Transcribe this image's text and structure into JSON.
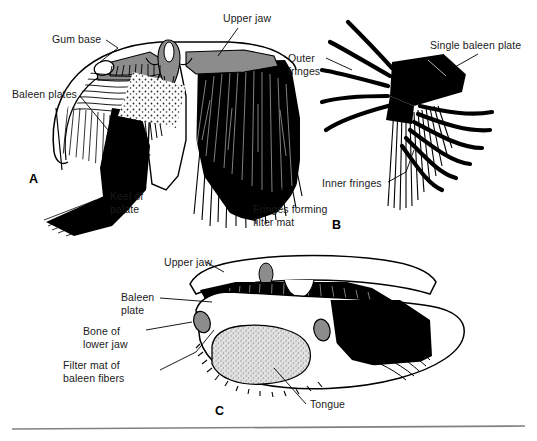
{
  "figure": {
    "background_color": "#ffffff",
    "ink_color": "#000000",
    "bone_gray": "#8c8c8c",
    "tongue_fill": "#d8d8d8",
    "rule_color": "#808080"
  },
  "panels": [
    {
      "letter": "A",
      "name": "cross-section-of-head",
      "labels": [
        {
          "id": "gum-base",
          "text": "Gum base"
        },
        {
          "id": "upper-jaw",
          "text": "Upper jaw"
        },
        {
          "id": "baleen-plates",
          "text": "Baleen plates"
        },
        {
          "id": "keel-of-palate",
          "line1": "Keel of",
          "line2": "palate"
        },
        {
          "id": "fringes-forming-filter-mat",
          "line1": "Fringes forming",
          "line2": "filter mat"
        }
      ]
    },
    {
      "letter": "B",
      "name": "single-baleen-plate",
      "labels": [
        {
          "id": "outer-fringes",
          "line1": "Outer",
          "line2": "fringes"
        },
        {
          "id": "single-baleen-plate",
          "text": "Single baleen plate"
        },
        {
          "id": "inner-fringes",
          "text": "Inner fringes"
        }
      ]
    },
    {
      "letter": "C",
      "name": "mouth-with-tongue",
      "labels": [
        {
          "id": "upper-jaw",
          "text": "Upper jaw"
        },
        {
          "id": "baleen-plate",
          "line1": "Baleen",
          "line2": "plate"
        },
        {
          "id": "bone-of-lower-jaw",
          "line1": "Bone of",
          "line2": "lower jaw"
        },
        {
          "id": "filter-mat-of-baleen-fibers",
          "line1": "Filter mat of",
          "line2": "baleen fibers"
        },
        {
          "id": "tongue",
          "text": "Tongue"
        }
      ]
    }
  ]
}
